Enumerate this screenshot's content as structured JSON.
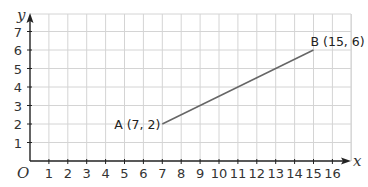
{
  "chart_data": {
    "type": "line",
    "title": "",
    "xlabel": "x",
    "ylabel": "y",
    "origin_label": "O",
    "xlim": [
      0,
      16
    ],
    "ylim": [
      0,
      7
    ],
    "x_ticks": [
      "1",
      "2",
      "3",
      "4",
      "5",
      "6",
      "7",
      "8",
      "9",
      "10",
      "11",
      "12",
      "13",
      "14",
      "15",
      "16"
    ],
    "y_ticks": [
      "1",
      "2",
      "3",
      "4",
      "5",
      "6",
      "7"
    ],
    "grid": true,
    "series": [
      {
        "name": "AB",
        "points": [
          {
            "label": "A (7, 2)",
            "x": 7,
            "y": 2
          },
          {
            "label": "B (15, 6)",
            "x": 15,
            "y": 6
          }
        ]
      }
    ]
  },
  "colors": {
    "grid": "#d4d4d4",
    "axis": "#222222",
    "segment": "#666666",
    "text": "#333333"
  }
}
